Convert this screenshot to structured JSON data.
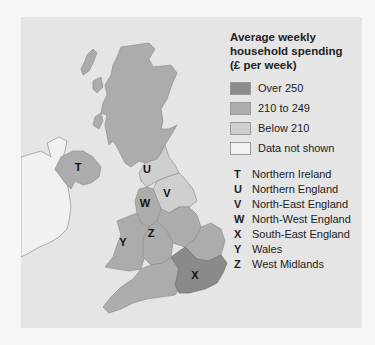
{
  "header_fragment": "",
  "legend": {
    "title_lines": [
      "Average weekly",
      "household spending",
      "(£ per week)"
    ],
    "categories": [
      {
        "label": "Over 250",
        "color": "#8a8a8a"
      },
      {
        "label": "210 to 249",
        "color": "#acacac"
      },
      {
        "label": "Below 210",
        "color": "#cfcfcf"
      },
      {
        "label": "Data not shown",
        "color": "#f2f2f2"
      }
    ]
  },
  "key": [
    {
      "letter": "T",
      "name": "Northern Ireland"
    },
    {
      "letter": "U",
      "name": "Northern England"
    },
    {
      "letter": "V",
      "name": "North-East England"
    },
    {
      "letter": "W",
      "name": "North-West England"
    },
    {
      "letter": "X",
      "name": "South-East England"
    },
    {
      "letter": "Y",
      "name": "Wales"
    },
    {
      "letter": "Z",
      "name": "West Midlands"
    }
  ],
  "map": {
    "regions": [
      {
        "id": "scotland",
        "category": "210 to 249"
      },
      {
        "id": "T",
        "category": "210 to 249"
      },
      {
        "id": "U",
        "category": "Below 210"
      },
      {
        "id": "V",
        "category": "Below 210"
      },
      {
        "id": "W",
        "category": "210 to 249"
      },
      {
        "id": "X",
        "category": "Over 250"
      },
      {
        "id": "Y",
        "category": "210 to 249"
      },
      {
        "id": "Z",
        "category": "210 to 249"
      },
      {
        "id": "east-midlands",
        "category": "210 to 249"
      },
      {
        "id": "east-of-england",
        "category": "210 to 249"
      },
      {
        "id": "south-west",
        "category": "210 to 249"
      },
      {
        "id": "republic-of-ireland",
        "category": "Data not shown"
      }
    ],
    "labels": {
      "T": "T",
      "U": "U",
      "V": "V",
      "W": "W",
      "X": "X",
      "Y": "Y",
      "Z": "Z"
    }
  }
}
